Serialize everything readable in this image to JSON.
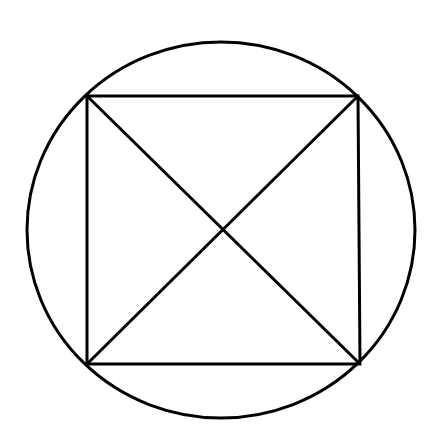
{
  "diagram": {
    "background": "#ffffff",
    "stroke_color": "#000000",
    "stroke_width": 3,
    "circle": {
      "cx": 221,
      "cy": 230,
      "rx": 194,
      "ry": 188
    },
    "square": {
      "corners": [
        {
          "name": "top-left",
          "x": 87,
          "y": 96
        },
        {
          "name": "top-right",
          "x": 358,
          "y": 96
        },
        {
          "name": "bottom-right",
          "x": 360,
          "y": 364
        },
        {
          "name": "bottom-left",
          "x": 87,
          "y": 364
        }
      ]
    },
    "diagonals": [
      {
        "from": "top-left",
        "to": "bottom-right"
      },
      {
        "from": "top-right",
        "to": "bottom-left"
      }
    ]
  }
}
